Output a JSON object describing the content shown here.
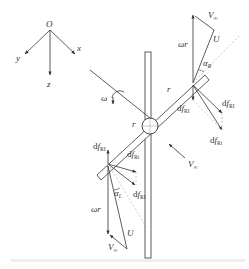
{
  "diagram": {
    "type": "rotor blade velocity and force decomposition",
    "axes": {
      "origin": "O",
      "x": "x",
      "y": "y",
      "z": "z"
    },
    "rotation": {
      "symbol": "ω"
    },
    "radius_labels": [
      "r",
      "r"
    ],
    "freestream": {
      "symbol": "V",
      "subscript": "∞"
    },
    "upper_blade": {
      "tangential_velocity": "ωr",
      "freestream": {
        "symbol": "V",
        "subscript": "∞"
      },
      "relative_velocity": "U",
      "angle": {
        "symbol": "α",
        "subscript": "R"
      },
      "forces": [
        {
          "prefix": "d",
          "symbol": "f",
          "subscript": "RI"
        },
        {
          "prefix": "d",
          "symbol": "f",
          "subscript": "RI"
        },
        {
          "prefix": "d",
          "symbol": "f",
          "subscript": "Rt"
        }
      ]
    },
    "lower_blade": {
      "tangential_velocity": "ωr",
      "freestream": {
        "symbol": "V",
        "subscript": "∞"
      },
      "relative_velocity": "U",
      "angle": {
        "symbol": "α",
        "subscript": "L"
      },
      "forces": [
        {
          "prefix": "d",
          "symbol": "f",
          "subscript": "RI"
        },
        {
          "prefix": "d",
          "symbol": "f",
          "subscript": "Rt"
        },
        {
          "prefix": "d",
          "symbol": "f",
          "subscript": "RI"
        }
      ]
    },
    "colors": {
      "line": "#333333",
      "dashed": "#aaaaaa",
      "caption": "#eeeeee"
    }
  }
}
